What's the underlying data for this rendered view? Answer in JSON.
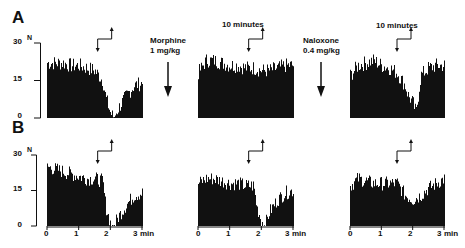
{
  "figure": {
    "panel_labels": [
      "A",
      "B"
    ],
    "y_axis": {
      "unit_label": "N",
      "ticks": [
        "30",
        "15",
        "0"
      ]
    },
    "x_axis": {
      "ticks": [
        "0",
        "1",
        "2",
        "3"
      ],
      "unit": "min"
    },
    "annotations": {
      "drug1": {
        "line1": "Morphine",
        "line2": "1 mg/kg"
      },
      "drug2": {
        "line1": "Naloxone",
        "line2": "0.4 mg/kg"
      },
      "interval1": "10 minutes",
      "interval2": "10 minutes"
    }
  },
  "chart_data": [
    {
      "type": "bar",
      "panel": "A",
      "condition": "baseline",
      "title": "",
      "xlabel": "min",
      "ylabel": "N",
      "ylim": [
        0,
        30
      ],
      "xlim": [
        0,
        3
      ],
      "x": [
        0.0,
        0.25,
        0.5,
        0.75,
        1.0,
        1.25,
        1.5,
        1.75,
        1.85,
        2.0,
        2.1,
        2.25,
        2.5,
        2.75,
        3.0
      ],
      "values": [
        22,
        22,
        22,
        21,
        21,
        20,
        19,
        15,
        8,
        2,
        0,
        4,
        9,
        13,
        14
      ],
      "stimulus_marker_min": 1.6
    },
    {
      "type": "bar",
      "panel": "A",
      "condition": "morphine 1 mg/kg (10 minutes later)",
      "xlabel": "min",
      "ylabel": "N",
      "ylim": [
        0,
        30
      ],
      "xlim": [
        0,
        3
      ],
      "x": [
        0.0,
        0.25,
        0.5,
        0.75,
        1.0,
        1.25,
        1.5,
        1.75,
        2.0,
        2.25,
        2.5,
        2.75,
        3.0
      ],
      "values": [
        18,
        23,
        23,
        22,
        21,
        21,
        20,
        20,
        19,
        19,
        20,
        21,
        21
      ],
      "stimulus_marker_min": 1.6
    },
    {
      "type": "bar",
      "panel": "A",
      "condition": "naloxone 0.4 mg/kg (10 minutes later)",
      "xlabel": "min",
      "ylabel": "N",
      "ylim": [
        0,
        30
      ],
      "xlim": [
        0,
        3
      ],
      "x": [
        0.0,
        0.25,
        0.5,
        0.75,
        1.0,
        1.25,
        1.5,
        1.75,
        1.85,
        2.0,
        2.1,
        2.25,
        2.5,
        2.75,
        3.0
      ],
      "values": [
        17,
        21,
        22,
        23,
        21,
        20,
        18,
        13,
        9,
        6,
        2,
        17,
        20,
        21,
        21
      ],
      "stimulus_marker_min": 1.5
    },
    {
      "type": "bar",
      "panel": "B",
      "condition": "baseline",
      "xlabel": "min",
      "ylabel": "N",
      "ylim": [
        0,
        30
      ],
      "xlim": [
        0,
        3
      ],
      "x": [
        0.0,
        0.25,
        0.5,
        0.75,
        1.0,
        1.25,
        1.5,
        1.75,
        1.85,
        2.0,
        2.1,
        2.25,
        2.5,
        2.75,
        3.0
      ],
      "values": [
        25,
        24,
        23,
        22,
        21,
        20,
        20,
        19,
        8,
        1,
        0,
        4,
        9,
        13,
        14
      ],
      "stimulus_marker_min": 1.6
    },
    {
      "type": "bar",
      "panel": "B",
      "condition": "treatment 2",
      "xlabel": "min",
      "ylabel": "N",
      "ylim": [
        0,
        30
      ],
      "xlim": [
        0,
        3
      ],
      "x": [
        0.0,
        0.25,
        0.5,
        0.75,
        1.0,
        1.25,
        1.5,
        1.75,
        1.85,
        2.0,
        2.1,
        2.25,
        2.5,
        2.75,
        3.0
      ],
      "values": [
        18,
        20,
        20,
        19,
        18,
        18,
        17,
        17,
        8,
        2,
        0,
        6,
        11,
        14,
        15
      ],
      "stimulus_marker_min": 1.6
    },
    {
      "type": "bar",
      "panel": "B",
      "condition": "treatment 3",
      "xlabel": "min",
      "ylabel": "N",
      "ylim": [
        0,
        30
      ],
      "xlim": [
        0,
        3
      ],
      "x": [
        0.0,
        0.25,
        0.5,
        0.75,
        1.0,
        1.25,
        1.5,
        1.75,
        2.0,
        2.25,
        2.5,
        2.75,
        3.0
      ],
      "values": [
        17,
        20,
        19,
        18,
        18,
        18,
        18,
        13,
        11,
        13,
        16,
        18,
        20
      ],
      "stimulus_marker_min": 1.5
    }
  ]
}
